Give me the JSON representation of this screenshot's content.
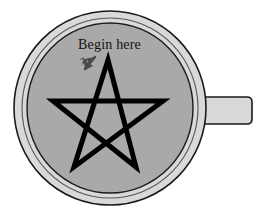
{
  "figure": {
    "title": "",
    "annotation": {
      "label": "Begin here",
      "pointer_icon": "down-left-arrow-icon",
      "pointer_target": "star-top-apex"
    },
    "colors": {
      "background": "#ffffff",
      "mug_rim_fill": "#d9d9d9",
      "mug_interior_fill": "#a9a9a9",
      "handle_fill": "#d9d9d9",
      "outline": "#1a1a1a",
      "star_stroke": "#000000",
      "text": "#141414",
      "arrow": "#4a4a4a"
    },
    "geometry": {
      "mug_center_x": 110,
      "mug_center_y": 108,
      "mug_outer_radius": 97,
      "mug_inner_radius": 84,
      "handle": {
        "x": 196,
        "y": 97,
        "width": 56,
        "height": 27,
        "corner_radius": 5
      },
      "star": {
        "type": "pentagram",
        "center_x": 108,
        "center_y": 117,
        "outer_radius": 57,
        "rotation_deg": -90,
        "stroke_width": 5,
        "points": [
          {
            "name": "top-apex",
            "x": 108,
            "y": 60
          },
          {
            "name": "right-point",
            "x": 163,
            "y": 101
          },
          {
            "name": "bottom-right-point",
            "x": 136,
            "y": 167
          },
          {
            "name": "bottom-left-point",
            "x": 74,
            "y": 167
          },
          {
            "name": "left-point",
            "x": 53,
            "y": 101
          }
        ]
      },
      "label_position": {
        "x": 78,
        "y": 49
      },
      "arrow_position": {
        "x": 82,
        "y": 58,
        "width": 14,
        "height": 18
      }
    }
  }
}
